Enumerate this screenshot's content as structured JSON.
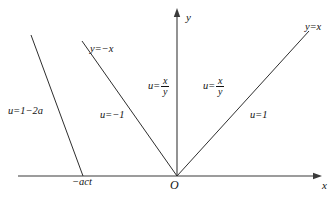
{
  "figure": {
    "type": "coordinate-plane-diagram",
    "background": "#ffffff",
    "stroke_color": "#333333"
  },
  "axes": {
    "x_label": "x",
    "y_label": "y",
    "origin_label": "O",
    "x_tick_label": "−act"
  },
  "lines": [
    {
      "name": "left-boundary-line",
      "label": "",
      "x1": 31,
      "y1": 35,
      "x2": 83,
      "y2": 176
    },
    {
      "name": "y-equals-minus-x-line",
      "label": "y=−x",
      "x1": 82,
      "y1": 41,
      "x2": 177,
      "y2": 176
    },
    {
      "name": "y-equals-x-line",
      "label": "y=x",
      "x1": 177,
      "y1": 176,
      "x2": 309,
      "y2": 31
    }
  ],
  "line_labels": {
    "minus_x": {
      "lhs": "y",
      "op": "=",
      "rhs": "−x"
    },
    "plus_x": {
      "lhs": "y",
      "op": "=",
      "rhs": "x"
    }
  },
  "regions": [
    {
      "name": "region-far-left",
      "lhs": "u",
      "op": "=",
      "rhs": "1−2a"
    },
    {
      "name": "region-left",
      "lhs": "u",
      "op": "=",
      "rhs": "−1"
    },
    {
      "name": "region-upper-left-fraction",
      "lhs": "u",
      "op": "=",
      "numerator": "x",
      "denominator": "y"
    },
    {
      "name": "region-upper-right-fraction",
      "lhs": "u",
      "op": "=",
      "numerator": "x",
      "denominator": "y"
    },
    {
      "name": "region-right",
      "lhs": "u",
      "op": "=",
      "rhs": "1"
    }
  ]
}
